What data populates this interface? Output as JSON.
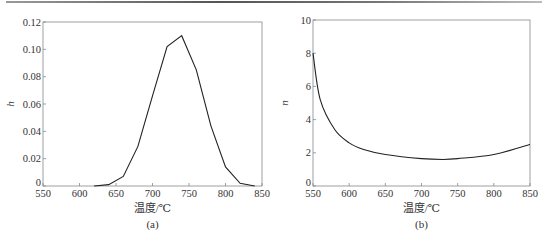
{
  "chart_data": [
    {
      "type": "line",
      "panel_label": "(a)",
      "title": "",
      "xlabel": "温度/℃",
      "ylabel": "h",
      "xlim": [
        550,
        850
      ],
      "ylim": [
        0,
        0.12
      ],
      "xticks": [
        550,
        600,
        650,
        700,
        750,
        800,
        850
      ],
      "xtick_labels": [
        "550",
        "600",
        "650",
        "700",
        "750",
        "800",
        "850"
      ],
      "yticks": [
        0,
        0.02,
        0.04,
        0.06,
        0.08,
        0.1,
        0.12
      ],
      "ytick_labels": [
        "0",
        "0.02",
        "0.04",
        "0.06",
        "0.08",
        "0.10",
        "0.12"
      ],
      "grid": false,
      "legend": null,
      "series": [
        {
          "name": "h",
          "x": [
            620,
            640,
            660,
            680,
            700,
            720,
            740,
            760,
            780,
            800,
            820,
            840
          ],
          "y": [
            0,
            0.001,
            0.007,
            0.029,
            0.066,
            0.102,
            0.11,
            0.085,
            0.044,
            0.014,
            0.002,
            0
          ]
        }
      ]
    },
    {
      "type": "line",
      "panel_label": "(b)",
      "title": "",
      "xlabel": "温度/℃",
      "ylabel": "n",
      "xlim": [
        550,
        850
      ],
      "ylim": [
        0,
        10
      ],
      "xticks": [
        550,
        600,
        650,
        700,
        750,
        800,
        850
      ],
      "xtick_labels": [
        "550",
        "600",
        "650",
        "700",
        "750",
        "800",
        "850"
      ],
      "yticks": [
        0,
        2,
        4,
        6,
        8,
        10
      ],
      "ytick_labels": [
        "0",
        "2",
        "4",
        "6",
        "8",
        "10"
      ],
      "grid": false,
      "legend": null,
      "series": [
        {
          "name": "n",
          "x": [
            550,
            560,
            580,
            600,
            620,
            650,
            700,
            730,
            750,
            800,
            850
          ],
          "y": [
            8.0,
            5.2,
            3.4,
            2.6,
            2.2,
            1.9,
            1.65,
            1.6,
            1.65,
            1.9,
            2.5
          ]
        }
      ]
    }
  ]
}
